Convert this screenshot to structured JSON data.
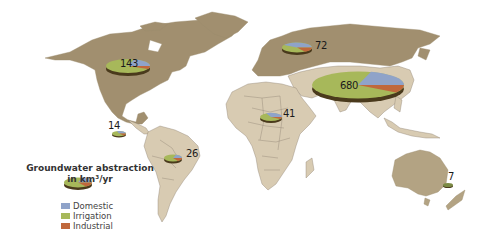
{
  "legend": {
    "title_line1": "Groundwater abstraction",
    "title_line2": "in km³/yr",
    "items": [
      {
        "label": "Domestic",
        "color": "#8fa3c9"
      },
      {
        "label": "Irrigation",
        "color": "#a7b85a"
      },
      {
        "label": "Industrial",
        "color": "#c0683c"
      }
    ]
  },
  "colors": {
    "dark_land": "#a18f6f",
    "light_land": "#d8cbb2",
    "border": "#8e8272",
    "pie_edge": "#4a3a1c"
  },
  "regions": [
    {
      "name": "North America",
      "value": "143"
    },
    {
      "name": "Central America & Caribbean",
      "value": "14"
    },
    {
      "name": "South America",
      "value": "26"
    },
    {
      "name": "Europe",
      "value": "72"
    },
    {
      "name": "Africa",
      "value": "41"
    },
    {
      "name": "Asia",
      "value": "680"
    },
    {
      "name": "Oceania",
      "value": "7"
    }
  ]
}
